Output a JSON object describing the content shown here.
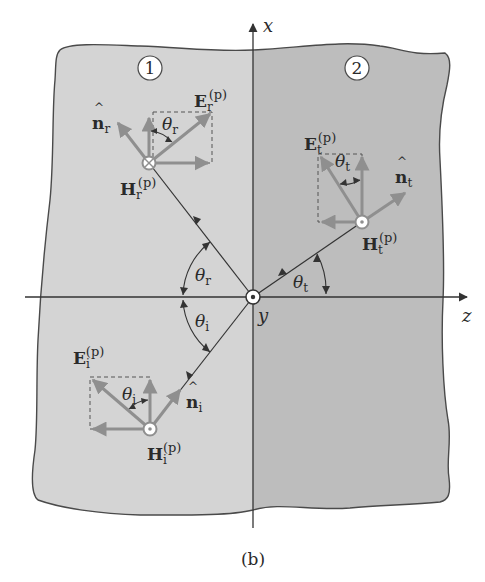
{
  "figure": {
    "caption": "(b)",
    "colors": {
      "medium1": "#d4d4d4",
      "medium2": "#bdbdbd",
      "outline": "#4a4a4a",
      "vector": "#8f8f8f",
      "ray": "#333333",
      "background": "#ffffff"
    }
  },
  "axes": {
    "x_label": "x",
    "z_label": "z",
    "y_label": "y"
  },
  "regions": [
    {
      "id": "medium-1",
      "label": "1"
    },
    {
      "id": "medium-2",
      "label": "2"
    }
  ],
  "waves": {
    "incident": {
      "E_label": "E",
      "E_sub": "i",
      "E_sup": "(p)",
      "H_label": "H",
      "H_sub": "i",
      "H_sup": "(p)",
      "n_label": "n",
      "n_sub": "i",
      "theta_label": "θ",
      "theta_sub": "i",
      "H_direction": "out-of-page"
    },
    "reflected": {
      "E_label": "E",
      "E_sub": "r",
      "E_sup": "(p)",
      "H_label": "H",
      "H_sub": "r",
      "H_sup": "(p)",
      "n_label": "n",
      "n_sub": "r",
      "theta_label": "θ",
      "theta_sub": "r",
      "H_direction": "into-page"
    },
    "transmitted": {
      "E_label": "E",
      "E_sub": "t",
      "E_sup": "(p)",
      "H_label": "H",
      "H_sub": "t",
      "H_sup": "(p)",
      "n_label": "n",
      "n_sub": "t",
      "theta_label": "θ",
      "theta_sub": "t",
      "H_direction": "out-of-page"
    }
  },
  "angles": {
    "theta_r": {
      "label": "θ",
      "sub": "r"
    },
    "theta_i": {
      "label": "θ",
      "sub": "i"
    },
    "theta_t": {
      "label": "θ",
      "sub": "t"
    }
  }
}
